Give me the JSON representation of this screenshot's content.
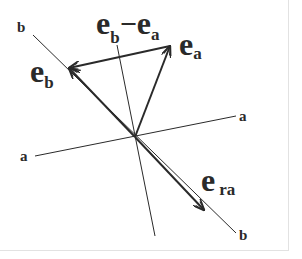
{
  "diagram": {
    "axes": {
      "a": {
        "label_start": "a",
        "label_end": "a"
      },
      "b": {
        "label_start": "b",
        "label_end": "b"
      }
    },
    "vectors": {
      "e_a": {
        "base": "e",
        "sub": "a"
      },
      "e_b": {
        "base": "e",
        "sub": "b"
      },
      "e_b_minus_e_a": {
        "base1": "e",
        "sub1": "b",
        "op": "−",
        "base2": "e",
        "sub2": "a"
      },
      "e_ra": {
        "base": "e",
        "sub": "ra"
      }
    },
    "colors": {
      "ink": "#2a2a2a",
      "background": "#ffffff",
      "frame": "#e2e2e2"
    }
  }
}
